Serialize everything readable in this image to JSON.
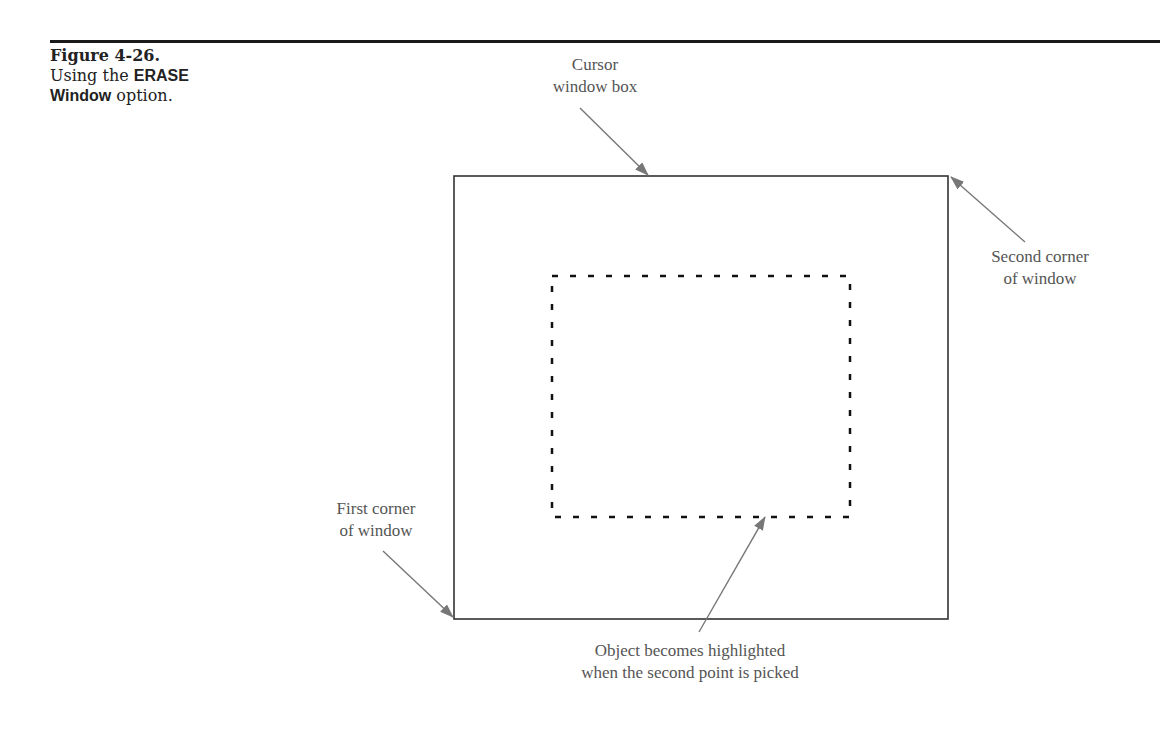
{
  "figure": {
    "number": "Figure 4-26.",
    "caption_prefix": "Using the",
    "caption_keyword_1": "ERASE",
    "caption_keyword_2": "Window",
    "caption_suffix": "option."
  },
  "labels": {
    "cursor_box_line1": "Cursor",
    "cursor_box_line2": "window box",
    "second_corner_line1": "Second corner",
    "second_corner_line2": "of window",
    "first_corner_line1": "First corner",
    "first_corner_line2": "of window",
    "object_line1": "Object becomes highlighted",
    "object_line2": "when the second point is picked"
  },
  "colors": {
    "box_stroke": "#333333",
    "dotted_object": "#111111",
    "arrow": "#777777",
    "label_text": "#555555"
  }
}
